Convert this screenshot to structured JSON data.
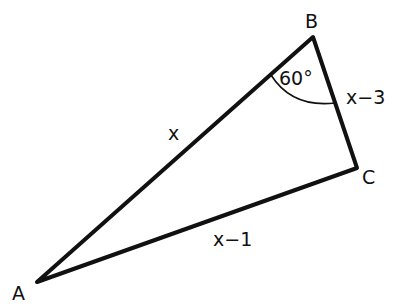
{
  "diagram": {
    "type": "triangle",
    "vertices": {
      "A": {
        "label": "A"
      },
      "B": {
        "label": "B"
      },
      "C": {
        "label": "C"
      }
    },
    "sides": {
      "AB": {
        "label": "x"
      },
      "AC": {
        "label": "x−1"
      },
      "BC": {
        "label": "x−3"
      }
    },
    "angle_B": {
      "label": "60°"
    },
    "stroke_color": "#111111"
  }
}
